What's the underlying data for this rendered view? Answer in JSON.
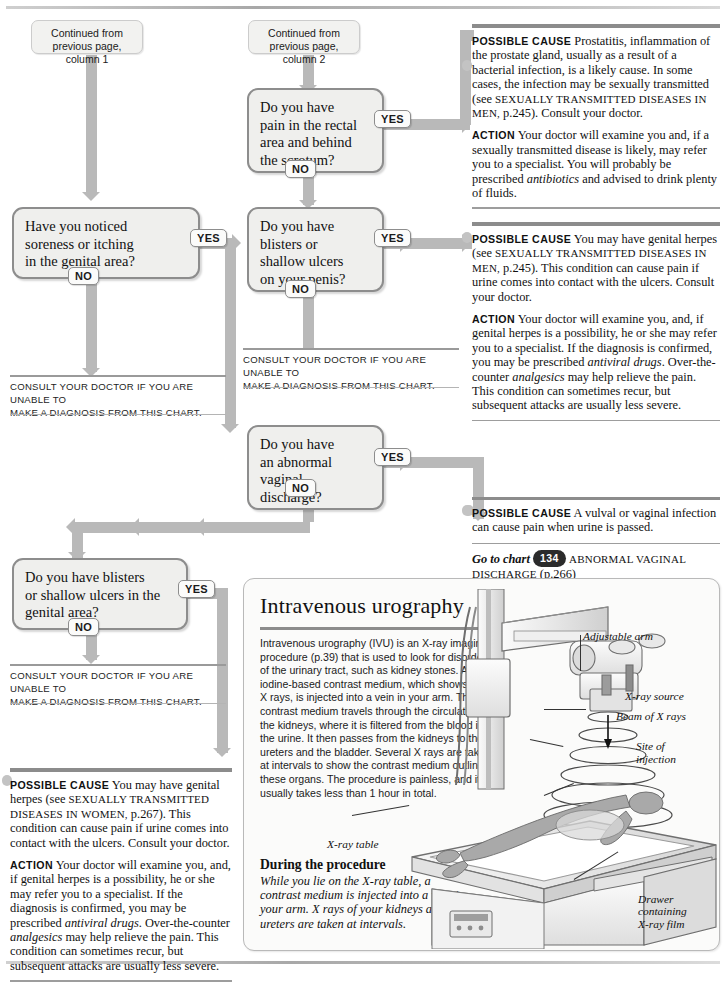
{
  "flow": {
    "continued_1": "Continued from\nprevious page, column 1",
    "continued_2": "Continued from\nprevious page, column 2",
    "yes": "YES",
    "no": "NO",
    "questions": [
      {
        "id": "q-rectal-pain",
        "text": "Do you have\npain in the rectal\narea and behind\nthe scrotum?"
      },
      {
        "id": "q-soreness-itching",
        "text": "Have you noticed\nsoreness or itching\nin the genital area?"
      },
      {
        "id": "q-blisters-penis",
        "text": "Do you have\nblisters or\nshallow ulcers\non your penis?"
      },
      {
        "id": "q-vaginal-discharge",
        "text": "Do you have\nan abnormal\nvaginal\ndischarge?"
      },
      {
        "id": "q-blisters-genital",
        "text": "Do you have blisters\nor shallow ulcers in the\ngenital area?"
      }
    ],
    "consult_line1": "CONSULT YOUR DOCTOR IF YOU ARE UNABLE TO",
    "consult_line2": "MAKE A DIAGNOSIS FROM THIS CHART.",
    "consult_mid_line1": "CONSULT YOUR DOCTOR IF YOU ARE UNABLE TO",
    "consult_mid_line2": "MAKE A DIAGNOSIS FROM THIS CHART."
  },
  "panels": {
    "prostatitis": {
      "cause_label": "POSSIBLE CAUSE",
      "cause_text_1": " Prostatitis, inflammation of the prostate gland, usually as a result of a bacterial infection, is a likely cause. In some cases, the infection may be sexually transmitted (see ",
      "cause_ref": "SEXUALLY TRANSMITTED DISEASES IN MEN,",
      "cause_text_2": " p.245). Consult your doctor.",
      "action_label": "ACTION",
      "action_text": " Your doctor will examine you and, if a sexually transmitted disease is likely, may refer you to a specialist. You will probably be prescribed ",
      "action_ital": "antibiotics",
      "action_text_2": " and advised to drink plenty of fluids."
    },
    "herpes_men": {
      "cause_label": "POSSIBLE CAUSE",
      "cause_text_1": " You may have genital herpes (see ",
      "cause_ref": "SEXUALLY TRANSMITTED DISEASES IN MEN,",
      "cause_text_2": " p.245). This condition can cause pain if urine comes into contact with the ulcers. Consult your doctor.",
      "action_label": "ACTION",
      "action_text": " Your doctor will examine you, and, if genital herpes is a possibility, he or she may refer you to a specialist. If the diagnosis is confirmed, you may be prescribed ",
      "action_ital_1": "antiviral drugs",
      "action_text_2": ". Over-the-counter ",
      "action_ital_2": "analgesics",
      "action_text_3": " may help relieve the pain. This condition can sometimes recur, but subsequent attacks are usually less severe."
    },
    "vulval": {
      "cause_label": "POSSIBLE CAUSE",
      "cause_text": " A vulval or vaginal infection can cause pain when urine is passed.",
      "goto_label": "Go to chart",
      "chart_number": "134",
      "chart_title": "ABNORMAL VAGINAL",
      "chart_title_2": "DISCHARGE",
      "chart_page": " (p.266)"
    },
    "herpes_women": {
      "cause_label": "POSSIBLE CAUSE",
      "cause_text_1": " You may have genital herpes (see ",
      "cause_ref": "SEXUALLY TRANSMITTED DISEASES IN",
      "cause_ref_2": "WOMEN,",
      "cause_text_2": " p.267). This condition can cause pain if urine comes into contact with the ulcers. Consult your doctor.",
      "action_label": "ACTION",
      "action_text": " Your doctor will examine you, and, if genital herpes is a possibility, he or she may refer you to a specialist. If the diagnosis is confirmed, you may be prescribed ",
      "action_ital_1": "antiviral drugs",
      "action_text_2": ". Over-the-counter ",
      "action_ital_2": "analgesics",
      "action_text_3": " may help relieve the pain. This condition can sometimes recur, but subsequent attacks are usually less severe."
    }
  },
  "infobox": {
    "title": "Intravenous urography",
    "body": "Intravenous urography (IVU) is an X-ray imaging procedure (p.39) that is used to look for disorders of the urinary tract, such as kidney stones. An iodine-based contrast medium, which shows up on X rays, is injected into a vein in your arm. The contrast medium travels through the circulation to the kidneys, where it is filtered from the blood into the urine. It then passes from the kidneys to the ureters and the bladder. Several X rays are taken at intervals to show the contrast medium outlining these organs. The procedure is painless, and it usually takes less than 1 hour in total.",
    "during_title": "During the procedure",
    "during_text": "While you lie on the X-ray table, a contrast medium is injected into a vein in your arm. X rays of your kidneys and ureters are taken at intervals.",
    "labels": {
      "adjustable_arm": "Adjustable arm",
      "xray_source": "X-ray source",
      "beam": "Beam of X rays",
      "site_of_injection": "Site of\ninjection",
      "xray_table": "X-ray table",
      "drawer": "Drawer\ncontaining\nX-ray film"
    }
  },
  "colors": {
    "connector": "#b9b9b9",
    "box_border": "#8d8d8d",
    "box_fill": "#efefed",
    "bar": "#8c8c8c",
    "chart_badge": "#2b2b2b"
  }
}
